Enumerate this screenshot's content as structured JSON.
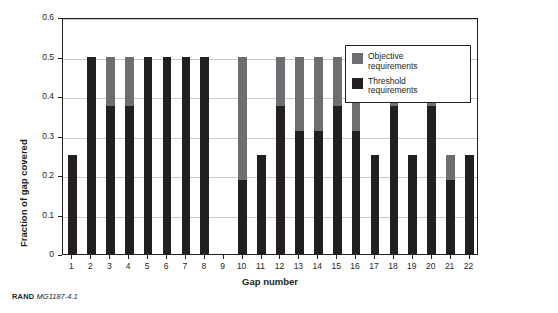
{
  "chart_data": {
    "type": "bar",
    "title": "",
    "xlabel": "Gap number",
    "ylabel": "Fraction of gap covered",
    "ylim": [
      0,
      0.6
    ],
    "yticks": [
      "0",
      "0.1",
      "0.2",
      "0.3",
      "0.4",
      "0.5",
      "0.6"
    ],
    "grid": true,
    "stacked": true,
    "legend_position": "top-right-inside",
    "categories": [
      "1",
      "2",
      "3",
      "4",
      "5",
      "6",
      "7",
      "8",
      "9",
      "10",
      "11",
      "12",
      "13",
      "14",
      "15",
      "16",
      "17",
      "18",
      "19",
      "20",
      "21",
      "22"
    ],
    "series": [
      {
        "name": "Threshold requirements",
        "color": "#231f20",
        "values": [
          0.25,
          0.5,
          0.375,
          0.375,
          0.5,
          0.5,
          0.5,
          0.5,
          0,
          0.1875,
          0.25,
          0.375,
          0.3125,
          0.3125,
          0.375,
          0.3125,
          0.25,
          0.375,
          0.25,
          0.375,
          0.1875,
          0.25
        ]
      },
      {
        "name": "Objective requirements",
        "color": "#6d6e71",
        "values": [
          0,
          0,
          0.125,
          0.125,
          0,
          0,
          0,
          0,
          0,
          0.3125,
          0,
          0.125,
          0.1875,
          0.1875,
          0.125,
          0.1875,
          0,
          0.125,
          0,
          0.125,
          0.0625,
          0
        ]
      }
    ],
    "totals": [
      0.25,
      0.5,
      0.5,
      0.5,
      0.5,
      0.5,
      0.5,
      0.5,
      0,
      0.5,
      0.25,
      0.5,
      0.5,
      0.5,
      0.5,
      0.5,
      0.25,
      0.5,
      0.25,
      0.5,
      0.25,
      0.25
    ]
  },
  "legend": {
    "items": [
      {
        "label": "Objective\nrequirements",
        "line1": "Objective",
        "line2": "requirements",
        "color": "#6d6e71"
      },
      {
        "label": "Threshold\nrequirements",
        "line1": "Threshold",
        "line2": "requirements",
        "color": "#231f20"
      }
    ]
  },
  "footer": {
    "organization": "RAND",
    "figure_code": "MG1187-4.1"
  }
}
